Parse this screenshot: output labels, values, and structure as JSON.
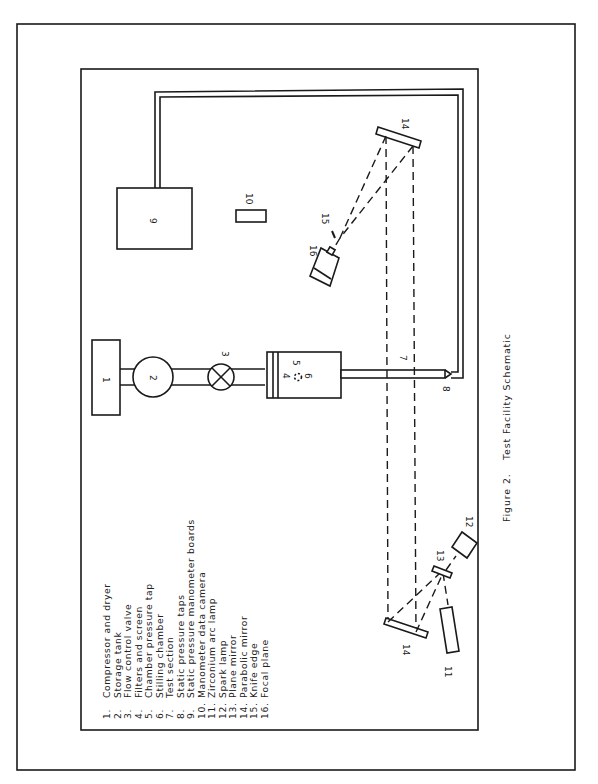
{
  "figure": {
    "caption_label": "Figure 2.",
    "caption_title": "Test Facility Schematic",
    "orientation": "rotated 90° counter-clockwise (reads bottom to top)"
  },
  "components": {
    "c1": "1",
    "c2": "2",
    "c3": "3",
    "c4": "4",
    "c5": "5",
    "c6": "6",
    "c7": "7",
    "c8": "8",
    "c9": "9",
    "c10": "10",
    "c11": "11",
    "c12": "12",
    "c13": "13",
    "c14a": "14",
    "c14b": "14",
    "c15": "15",
    "c16": "16"
  },
  "legend": [
    {
      "num": "1.",
      "text": "Compressor and dryer"
    },
    {
      "num": "2.",
      "text": "Storage tank"
    },
    {
      "num": "3.",
      "text": "Flow control valve"
    },
    {
      "num": "4.",
      "text": "Filters and screen"
    },
    {
      "num": "5.",
      "text": "Chamber pressure tap"
    },
    {
      "num": "6.",
      "text": "Stilling chamber"
    },
    {
      "num": "7.",
      "text": "Test section"
    },
    {
      "num": "8.",
      "text": "Static pressure taps"
    },
    {
      "num": "9.",
      "text": "Static pressure manometer boards"
    },
    {
      "num": "10.",
      "text": "Manometer data camera"
    },
    {
      "num": "11.",
      "text": "Zirconium arc lamp"
    },
    {
      "num": "12.",
      "text": "Spark lamp"
    },
    {
      "num": "13.",
      "text": "Plane mirror"
    },
    {
      "num": "14.",
      "text": "Parabolic mirror"
    },
    {
      "num": "15.",
      "text": "Knife edge"
    },
    {
      "num": "16.",
      "text": "Focal plane"
    }
  ],
  "colors": {
    "ink": "#1a1a1a",
    "paper": "#ffffff"
  }
}
